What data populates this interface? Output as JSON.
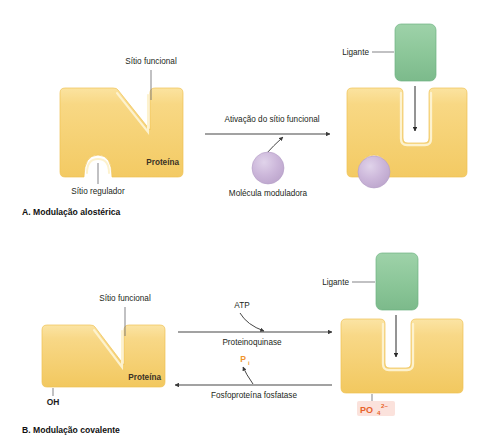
{
  "figure": {
    "panels": [
      {
        "id": "A",
        "caption": "A. Modulação alostérica",
        "labels": {
          "functional_site": "Sítio funcional",
          "regulator_site": "Sítio regulador",
          "protein": "Proteína",
          "ligand": "Ligante",
          "modulator": "Molécula moduladora",
          "reaction": "Ativação do sítio funcional"
        }
      },
      {
        "id": "B",
        "caption": "B. Modulação covalente",
        "labels": {
          "functional_site": "Sítio funcional",
          "protein": "Proteína",
          "ligand": "Ligante",
          "hydroxyl": "OH",
          "atp": "ATP",
          "kinase": "Proteinoquinase",
          "phosphatase": "Fosfoproteína fosfatase",
          "inorganic_phosphate_symbol": "P",
          "inorganic_phosphate_subscript": "i",
          "phosphate_symbol": "PO",
          "phosphate_subscript": "4",
          "phosphate_charge": "2–"
        }
      }
    ]
  },
  "colors": {
    "protein_fill": "#f6d272",
    "protein_fill_light": "#fae6a8",
    "protein_edge": "#f2c65a",
    "protein_highlight": "#fdf0c7",
    "ligand_fill": "#8cc79a",
    "ligand_edge": "#6fb382",
    "modulator_fill": "#c9b3d8",
    "modulator_edge": "#b49ec6",
    "phosphate_text": "#e8622a",
    "phosphate_badge": "#fbe2dc",
    "pi_text": "#f0952e",
    "arrow": "#3b3b3b",
    "leader": "#6d6e71",
    "text": "#231f20",
    "background": "#ffffff"
  }
}
